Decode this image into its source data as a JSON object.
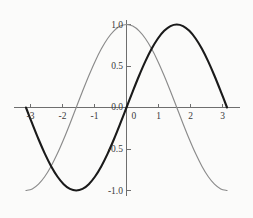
{
  "figure": {
    "background_color": "#fbfbfa",
    "width": 253,
    "height": 218
  },
  "chart_data": {
    "type": "line",
    "title": "",
    "subtitle": "",
    "xlabel": "",
    "ylabel": "",
    "xlim": [
      -3.35,
      3.35
    ],
    "ylim": [
      -1.12,
      1.12
    ],
    "grid": false,
    "legend": "none",
    "x_ticks": [
      -3,
      -2,
      -1,
      0,
      1,
      2,
      3
    ],
    "x_tick_labels": [
      "-3",
      "-2",
      "-1",
      "0",
      "1",
      "2",
      "3"
    ],
    "y_ticks": [
      -1.0,
      -0.5,
      0.0,
      0.5,
      1.0
    ],
    "y_tick_labels": [
      "-1.0",
      "-0.5",
      "0.0",
      "0.5",
      "1.0"
    ],
    "axes_style": "centered-spines",
    "x_domain_plotted": [
      -3.14159,
      3.14159
    ],
    "series": [
      {
        "name": "sin(x)",
        "color": "#1a1a1a",
        "line_width": 2.1,
        "x": [
          -3.14159,
          -2.9452,
          -2.7489,
          -2.5525,
          -2.3562,
          -2.1598,
          -1.9635,
          -1.7671,
          -1.5708,
          -1.3744,
          -1.1781,
          -0.9817,
          -0.7854,
          -0.589,
          -0.3927,
          -0.1963,
          0,
          0.1963,
          0.3927,
          0.589,
          0.7854,
          0.9817,
          1.1781,
          1.3744,
          1.5708,
          1.7671,
          1.9635,
          2.1598,
          2.3562,
          2.5525,
          2.7489,
          2.9452,
          3.14159
        ],
        "y": [
          0,
          -0.1951,
          -0.3827,
          -0.5556,
          -0.7071,
          -0.8315,
          -0.9239,
          -0.9808,
          -1,
          -0.9808,
          -0.9239,
          -0.8315,
          -0.7071,
          -0.5556,
          -0.3827,
          -0.1951,
          0,
          0.1951,
          0.3827,
          0.5556,
          0.7071,
          0.8315,
          0.9239,
          0.9808,
          1,
          0.9808,
          0.9239,
          0.8315,
          0.7071,
          0.5556,
          0.3827,
          0.1951,
          0
        ]
      },
      {
        "name": "cos(x)",
        "color": "#8b8b8b",
        "line_width": 1.15,
        "x": [
          -3.14159,
          -2.9452,
          -2.7489,
          -2.5525,
          -2.3562,
          -2.1598,
          -1.9635,
          -1.7671,
          -1.5708,
          -1.3744,
          -1.1781,
          -0.9817,
          -0.7854,
          -0.589,
          -0.3927,
          -0.1963,
          0,
          0.1963,
          0.3927,
          0.589,
          0.7854,
          0.9817,
          1.1781,
          1.3744,
          1.5708,
          1.7671,
          1.9635,
          2.1598,
          2.3562,
          2.5525,
          2.7489,
          2.9452,
          3.14159
        ],
        "y": [
          -1,
          -0.9808,
          -0.9239,
          -0.8315,
          -0.7071,
          -0.5556,
          -0.3827,
          -0.1951,
          0,
          0.1951,
          0.3827,
          0.5556,
          0.7071,
          0.8315,
          0.9239,
          0.9808,
          1,
          0.9808,
          0.9239,
          0.8315,
          0.7071,
          0.5556,
          0.3827,
          0.1951,
          0,
          -0.1951,
          -0.3827,
          -0.5556,
          -0.7071,
          -0.8315,
          -0.9239,
          -0.9808,
          -1
        ]
      }
    ],
    "annotations": []
  },
  "axis_labels": {
    "x": {
      "m3": "-3",
      "m2": "-2",
      "m1": "-1",
      "zero": "0",
      "p1": "1",
      "p2": "2",
      "p3": "3"
    },
    "y": {
      "m1": "-1.0",
      "mhalf": "-0.5",
      "zero": "0.0",
      "phalf": "0.5",
      "p1": "1.0"
    }
  }
}
